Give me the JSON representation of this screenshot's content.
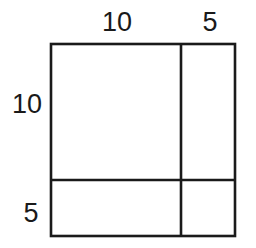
{
  "diagram": {
    "type": "area-model",
    "top_labels": [
      "10",
      "5"
    ],
    "left_labels": [
      "10",
      "5"
    ],
    "line_color": "#1a1a1a",
    "background": "#ffffff",
    "regions": [
      {
        "row": 0,
        "col": 0,
        "width": 10,
        "height": 10
      },
      {
        "row": 0,
        "col": 1,
        "width": 5,
        "height": 10
      },
      {
        "row": 1,
        "col": 0,
        "width": 10,
        "height": 5
      },
      {
        "row": 1,
        "col": 1,
        "width": 5,
        "height": 5
      }
    ]
  }
}
